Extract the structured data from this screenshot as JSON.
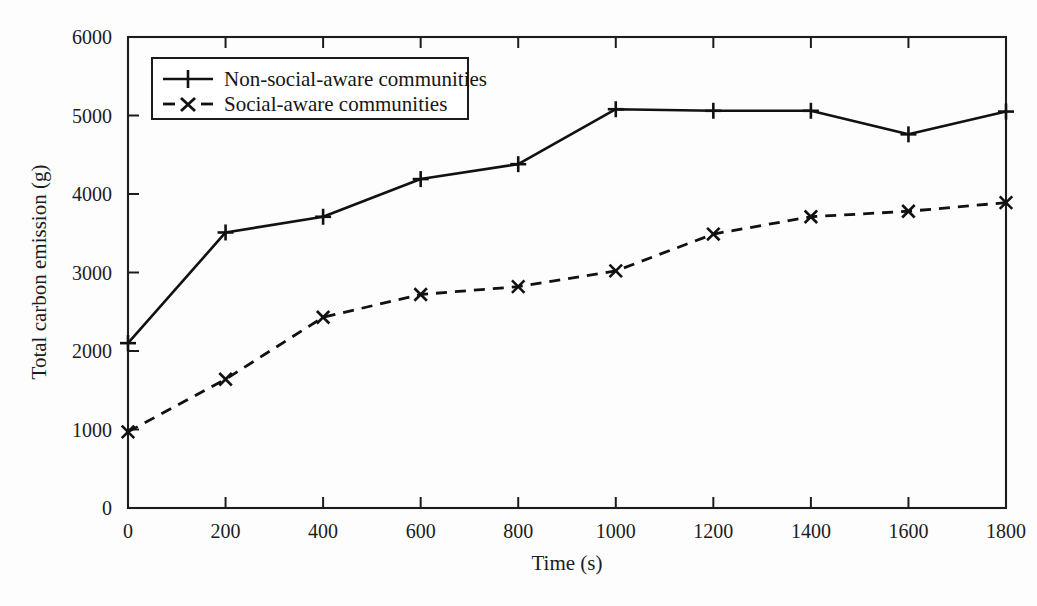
{
  "chart_data": {
    "type": "line",
    "title": "",
    "xlabel": "Time (s)",
    "ylabel": "Total carbon emission (g)",
    "xlim": [
      0,
      1800
    ],
    "ylim": [
      0,
      6000
    ],
    "xticks": [
      0,
      200,
      400,
      600,
      800,
      1000,
      1200,
      1400,
      1600,
      1800
    ],
    "yticks": [
      0,
      1000,
      2000,
      3000,
      4000,
      5000,
      6000
    ],
    "xtick_labels": [
      "0",
      "200",
      "400",
      "600",
      "800",
      "1000",
      "1200",
      "1400",
      "1600",
      "1800"
    ],
    "ytick_labels": [
      "0",
      "1000",
      "2000",
      "3000",
      "4000",
      "5000",
      "6000"
    ],
    "grid": false,
    "legend_position": "upper-left-inside",
    "x": [
      0,
      200,
      400,
      600,
      800,
      1000,
      1200,
      1400,
      1600,
      1800
    ],
    "series": [
      {
        "name": "Non-social-aware communities",
        "marker": "plus",
        "linestyle": "solid",
        "color": "#111111",
        "values": [
          2100,
          3510,
          3710,
          4190,
          4380,
          5080,
          5060,
          5060,
          4760,
          5050
        ]
      },
      {
        "name": "Social-aware communities",
        "marker": "cross",
        "linestyle": "dashed",
        "color": "#111111",
        "values": [
          970,
          1640,
          2430,
          2720,
          2820,
          3020,
          3490,
          3710,
          3780,
          3890
        ]
      }
    ]
  },
  "axes": {
    "x_title": "Time (s)",
    "y_title": "Total carbon emission (g)"
  },
  "legend": {
    "entries": [
      {
        "label": "Non-social-aware communities",
        "marker": "plus-marker",
        "linestyle": "solid"
      },
      {
        "label": "Social-aware communities",
        "marker": "cross-marker",
        "linestyle": "dashed"
      }
    ]
  },
  "ticks": {
    "y": [
      "6000",
      "5000",
      "4000",
      "3000",
      "2000",
      "1000",
      "0"
    ],
    "x": [
      "0",
      "200",
      "400",
      "600",
      "800",
      "1000",
      "1200",
      "1400",
      "1600",
      "1800"
    ]
  },
  "colors": {
    "ink": "#111111",
    "frame": "#1c1c1c",
    "background": "#fdfdfd"
  }
}
